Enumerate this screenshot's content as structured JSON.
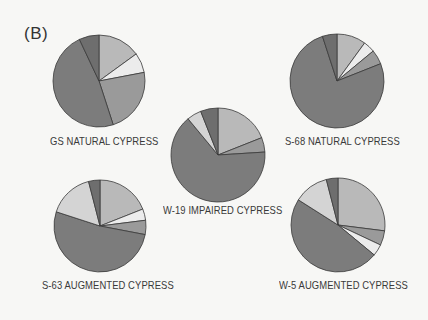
{
  "panel_label": "(B)",
  "colors": {
    "light_gray": "#b9b9b9",
    "white": "#ececec",
    "medium_gray": "#9a9a9a",
    "dark_gray": "#7c7c7c",
    "very_light_gray": "#d4d4d4",
    "medium_dark_gray": "#6e6e6e",
    "stroke": "#3a3a3a"
  },
  "chart_data": [
    {
      "type": "pie",
      "title": "GS NATURAL CYPRESS",
      "center": [
        99,
        81
      ],
      "radius": 46,
      "label_pos": [
        50,
        142
      ],
      "slices": [
        {
          "color": "light_gray",
          "value": 15
        },
        {
          "color": "white",
          "value": 7
        },
        {
          "color": "medium_gray",
          "value": 23
        },
        {
          "color": "dark_gray",
          "value": 48
        },
        {
          "color": "medium_dark_gray",
          "value": 7
        }
      ]
    },
    {
      "type": "pie",
      "title": "S-68 NATURAL CYPRESS",
      "center": [
        337,
        81
      ],
      "radius": 47,
      "label_pos": [
        285,
        142
      ],
      "slices": [
        {
          "color": "light_gray",
          "value": 10
        },
        {
          "color": "white",
          "value": 4
        },
        {
          "color": "medium_gray",
          "value": 5
        },
        {
          "color": "dark_gray",
          "value": 76
        },
        {
          "color": "medium_dark_gray",
          "value": 5
        }
      ]
    },
    {
      "type": "pie",
      "title": "W-19 IMPAIRED CYPRESS",
      "center": [
        218,
        155
      ],
      "radius": 47,
      "label_pos": [
        163,
        211
      ],
      "slices": [
        {
          "color": "light_gray",
          "value": 19
        },
        {
          "color": "medium_gray",
          "value": 5
        },
        {
          "color": "dark_gray",
          "value": 65
        },
        {
          "color": "very_light_gray",
          "value": 5
        },
        {
          "color": "medium_dark_gray",
          "value": 6
        }
      ]
    },
    {
      "type": "pie",
      "title": "S-63 AUGMENTED CYPRESS",
      "center": [
        100,
        226
      ],
      "radius": 46,
      "label_pos": [
        42,
        286
      ],
      "slices": [
        {
          "color": "light_gray",
          "value": 19
        },
        {
          "color": "white",
          "value": 4
        },
        {
          "color": "medium_gray",
          "value": 5
        },
        {
          "color": "dark_gray",
          "value": 52
        },
        {
          "color": "very_light_gray",
          "value": 16
        },
        {
          "color": "medium_dark_gray",
          "value": 4
        }
      ]
    },
    {
      "type": "pie",
      "title": "W-5 AUGMENTED CYPRESS",
      "center": [
        338,
        225
      ],
      "radius": 47,
      "label_pos": [
        279,
        286
      ],
      "slices": [
        {
          "color": "light_gray",
          "value": 27
        },
        {
          "color": "medium_gray",
          "value": 5
        },
        {
          "color": "white",
          "value": 4
        },
        {
          "color": "dark_gray",
          "value": 48
        },
        {
          "color": "very_light_gray",
          "value": 12
        },
        {
          "color": "medium_dark_gray",
          "value": 4
        }
      ]
    }
  ]
}
